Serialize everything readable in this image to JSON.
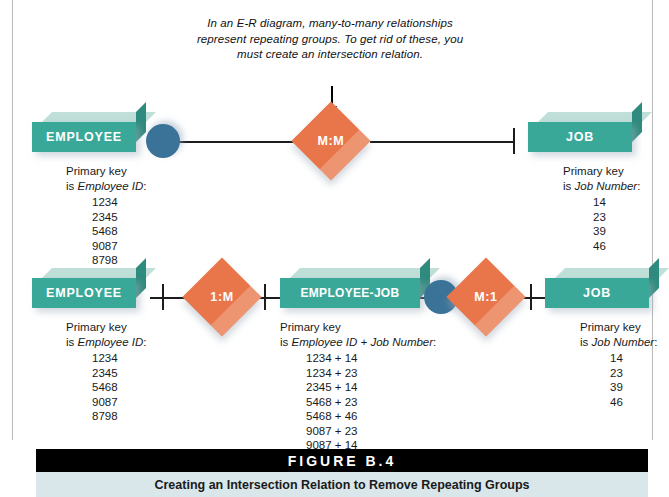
{
  "annotation": {
    "text": "In an E-R diagram, many-to-many relationships represent repeating groups. To get rid of these, you must create an intersection relation."
  },
  "diagram_top": {
    "employee": {
      "label": "EMPLOYEE",
      "key_line1": "Primary key",
      "key_line2_prefix": "is ",
      "key_line2_field": "Employee ID",
      "key_line2_suffix": ":",
      "values": [
        "1234",
        "2345",
        "5468",
        "9087",
        "8798"
      ]
    },
    "relationship": {
      "label": "M:M"
    },
    "job": {
      "label": "JOB",
      "key_line1": "Primary key",
      "key_line2_prefix": "is ",
      "key_line2_field": "Job Number",
      "key_line2_suffix": ":",
      "values": [
        "14",
        "23",
        "39",
        "46"
      ]
    }
  },
  "diagram_bottom": {
    "employee": {
      "label": "EMPLOYEE",
      "key_line1": "Primary key",
      "key_line2_prefix": "is ",
      "key_line2_field": "Employee ID",
      "key_line2_suffix": ":",
      "values": [
        "1234",
        "2345",
        "5468",
        "9087",
        "8798"
      ]
    },
    "relationship_left": {
      "label": "1:M"
    },
    "intersection": {
      "label": "EMPLOYEE-JOB",
      "key_line1": "Primary key",
      "key_line2_prefix": "is ",
      "key_line2_field": "Employee ID + Job Number",
      "key_line2_suffix": ":",
      "values": [
        "1234 + 14",
        "1234 + 23",
        "2345 + 14",
        "5468 + 23",
        "5468 + 46",
        "9087 + 23",
        "9087 + 14",
        "8798 + 39"
      ]
    },
    "relationship_right": {
      "label": "M:1"
    },
    "job": {
      "label": "JOB",
      "key_line1": "Primary key",
      "key_line2_prefix": "is ",
      "key_line2_field": "Job Number",
      "key_line2_suffix": ":",
      "values": [
        "14",
        "23",
        "39",
        "46"
      ]
    }
  },
  "figure": {
    "number": "FIGURE B.4",
    "caption": "Creating an Intersection Relation to Remove Repeating Groups"
  },
  "colors": {
    "entity": "#3aa898",
    "entity_top": "#bfdfd8",
    "entity_side": "#2e8b7d",
    "relationship": "#e8764a",
    "connector": "#3a7298",
    "line": "#1c1c1c",
    "caption_bar": "#000000",
    "caption_band": "#d9e7ea"
  }
}
